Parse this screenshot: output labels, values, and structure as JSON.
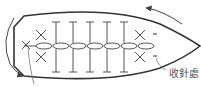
{
  "diagram": {
    "type": "crochet-chart",
    "label_finish": "收針處",
    "colors": {
      "outline": "#333333",
      "stitch": "#555555",
      "arrow": "#444444",
      "leader": "#777777"
    },
    "dc_columns_x": [
      56,
      73,
      90,
      107,
      124
    ],
    "chain_ovals_x": [
      44,
      61,
      78,
      95,
      112,
      129,
      146
    ]
  }
}
